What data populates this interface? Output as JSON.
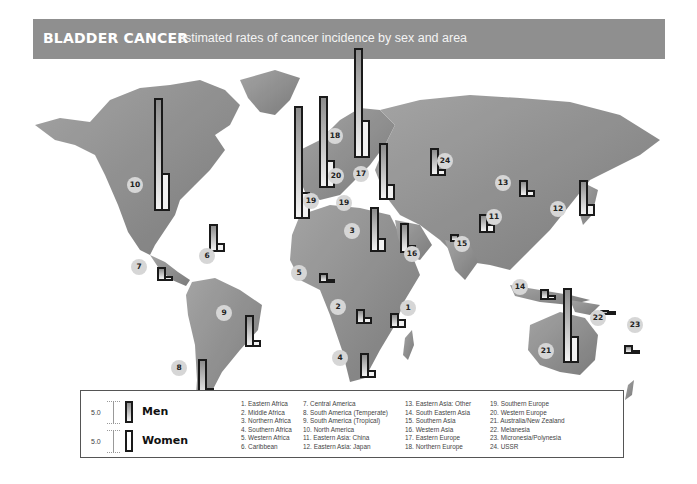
{
  "header": {
    "title": "BLADDER CANCER",
    "subtitle": "estimated rates of cancer incidence by sex and area"
  },
  "legend": {
    "scale_value": "5.0",
    "series": [
      {
        "name": "Men",
        "fill": "gradient-gray"
      },
      {
        "name": "Women",
        "fill": "white"
      }
    ],
    "regions": [
      "1.  Eastern Africa",
      "2.  Middle Africa",
      "3.  Northern Africa",
      "4.  Southern Africa",
      "5.  Western Africa",
      "6.  Caribbean",
      "7.  Central America",
      "8.  South America (Temperate)",
      "9.  South America (Tropical)",
      "10. North America",
      "11. Eastern Asia: China",
      "12. Eastern Asia: Japan",
      "13. Eastern Asia: Other",
      "14. South Eastern Asia",
      "15. Southern Asia",
      "16.  Western Asia",
      "17. Eastern Europe",
      "18. Northern Europe",
      "19. Southern Europe",
      "20. Western Europe",
      "21. Australia/New Zealand",
      "22. Melanesia",
      "23. Micronesia/Polynesia",
      "24. USSR"
    ]
  },
  "chart_data": {
    "type": "bar",
    "title": "BLADDER CANCER",
    "subtitle": "estimated rates of cancer incidence by sex and area",
    "xlabel": "",
    "ylabel": "Incidence rate (bar scale: 5.0 units)",
    "legend_position": "bottom-left",
    "grid": false,
    "categories": [
      "Eastern Africa",
      "Middle Africa",
      "Northern Africa",
      "Southern Africa",
      "Western Africa",
      "Caribbean",
      "Central America",
      "South America (Temperate)",
      "South America (Tropical)",
      "North America",
      "Eastern Asia: China",
      "Eastern Asia: Japan",
      "Eastern Asia: Other",
      "South Eastern Asia",
      "Southern Asia",
      "Western Asia",
      "Eastern Europe",
      "Northern Europe",
      "Southern Europe",
      "Western Europe",
      "Australia/New Zealand",
      "Melanesia",
      "Micronesia/Polynesia",
      "USSR"
    ],
    "series": [
      {
        "name": "Men",
        "values": [
          3.5,
          3.5,
          12.0,
          5.5,
          2.5,
          7.0,
          3.5,
          10.0,
          8.0,
          25.0,
          5.0,
          10.5,
          4.0,
          2.5,
          2.0,
          7.5,
          12.5,
          23.0,
          23.5,
          20.0,
          18.5,
          1.0,
          2.0,
          7.0
        ]
      },
      {
        "name": "Women",
        "values": [
          2.0,
          1.5,
          2.5,
          2.0,
          1.0,
          2.0,
          1.5,
          2.5,
          1.5,
          6.5,
          2.5,
          2.5,
          1.5,
          1.0,
          0.5,
          2.0,
          3.0,
          8.0,
          4.0,
          5.0,
          5.5,
          0.5,
          0.5,
          1.5
        ]
      }
    ]
  },
  "map_markers": [
    {
      "id": "1",
      "badge_x": 408,
      "badge_y": 308,
      "bar_x": 390,
      "bar_bottom": 328,
      "men_h": 15,
      "women_h": 9
    },
    {
      "id": "2",
      "badge_x": 338,
      "badge_y": 307,
      "bar_x": 356,
      "bar_bottom": 324,
      "men_h": 15,
      "women_h": 7
    },
    {
      "id": "3",
      "badge_x": 352,
      "badge_y": 231,
      "bar_x": 370,
      "bar_bottom": 252,
      "men_h": 45,
      "women_h": 14
    },
    {
      "id": "4",
      "badge_x": 340,
      "badge_y": 358,
      "bar_x": 360,
      "bar_bottom": 378,
      "men_h": 25,
      "women_h": 8
    },
    {
      "id": "5",
      "badge_x": 299,
      "badge_y": 273,
      "bar_x": 319,
      "bar_bottom": 283,
      "men_h": 10,
      "women_h": 4
    },
    {
      "id": "6",
      "badge_x": 207,
      "badge_y": 256,
      "bar_x": 209,
      "bar_bottom": 252,
      "men_h": 28,
      "women_h": 9
    },
    {
      "id": "7",
      "badge_x": 139,
      "badge_y": 267,
      "bar_x": 157,
      "bar_bottom": 281,
      "men_h": 14,
      "women_h": 5
    },
    {
      "id": "8",
      "badge_x": 179,
      "badge_y": 368,
      "bar_x": 198,
      "bar_bottom": 399,
      "men_h": 40,
      "women_h": 11
    },
    {
      "id": "9",
      "badge_x": 224,
      "badge_y": 313,
      "bar_x": 245,
      "bar_bottom": 347,
      "men_h": 32,
      "women_h": 7
    },
    {
      "id": "10",
      "badge_x": 135,
      "badge_y": 185,
      "bar_x": 154,
      "bar_bottom": 211,
      "men_h": 113,
      "women_h": 38
    },
    {
      "id": "11",
      "badge_x": 494,
      "badge_y": 217,
      "bar_x": 479,
      "bar_bottom": 233,
      "men_h": 19,
      "women_h": 9
    },
    {
      "id": "12",
      "badge_x": 558,
      "badge_y": 209,
      "bar_x": 579,
      "bar_bottom": 216,
      "men_h": 36,
      "women_h": 12
    },
    {
      "id": "13",
      "badge_x": 503,
      "badge_y": 183,
      "bar_x": 519,
      "bar_bottom": 197,
      "men_h": 17,
      "women_h": 7
    },
    {
      "id": "14",
      "badge_x": 520,
      "badge_y": 287,
      "bar_x": 540,
      "bar_bottom": 300,
      "men_h": 11,
      "women_h": 5
    },
    {
      "id": "15",
      "badge_x": 462,
      "badge_y": 244,
      "bar_x": 450,
      "bar_bottom": 242,
      "men_h": 8,
      "women_h": 2
    },
    {
      "id": "16",
      "badge_x": 412,
      "badge_y": 254,
      "bar_x": 400,
      "bar_bottom": 253,
      "men_h": 30,
      "women_h": 8
    },
    {
      "id": "17",
      "badge_x": 361,
      "badge_y": 174,
      "bar_x": 379,
      "bar_bottom": 200,
      "men_h": 57,
      "women_h": 16
    },
    {
      "id": "18",
      "badge_x": 335,
      "badge_y": 136,
      "bar_x": 354,
      "bar_bottom": 158,
      "men_h": 110,
      "women_h": 38
    },
    {
      "id": "19a",
      "badge_x": 311,
      "badge_y": 201,
      "bar_x": 294,
      "bar_bottom": 219,
      "men_h": 113,
      "women_h": 27
    },
    {
      "id": "19b",
      "badge_x": 344,
      "badge_y": 203,
      "bar_x": null,
      "bar_bottom": null,
      "men_h": 0,
      "women_h": 0
    },
    {
      "id": "20",
      "badge_x": 336,
      "badge_y": 176,
      "bar_x": 319,
      "bar_bottom": 188,
      "men_h": 92,
      "women_h": 28
    },
    {
      "id": "21",
      "badge_x": 546,
      "badge_y": 351,
      "bar_x": 563,
      "bar_bottom": 363,
      "men_h": 75,
      "women_h": 27
    },
    {
      "id": "22",
      "badge_x": 598,
      "badge_y": 318,
      "bar_x": 600,
      "bar_bottom": 315,
      "men_h": 5,
      "women_h": 2
    },
    {
      "id": "23",
      "badge_x": 635,
      "badge_y": 325,
      "bar_x": 624,
      "bar_bottom": 354,
      "men_h": 9,
      "women_h": 3
    },
    {
      "id": "24",
      "badge_x": 445,
      "badge_y": 161,
      "bar_x": 430,
      "bar_bottom": 176,
      "men_h": 28,
      "women_h": 7
    }
  ]
}
